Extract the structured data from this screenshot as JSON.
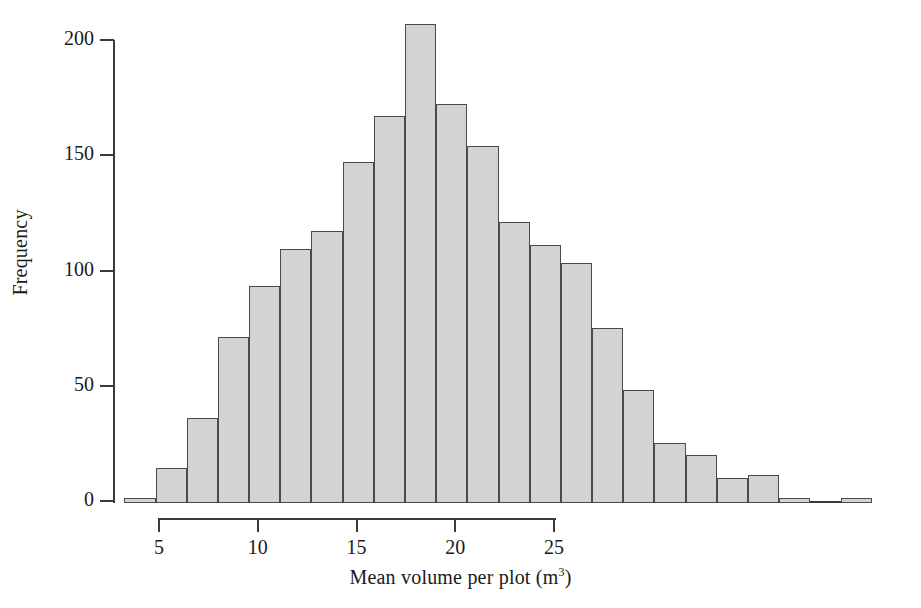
{
  "chart_data": {
    "type": "bar",
    "title": "",
    "subtitle": "",
    "xlabel_main": "Mean volume per plot (m",
    "xlabel_exponent": "3",
    "xlabel_close": ")",
    "xlabel": "Mean volume per plot (m3)",
    "ylabel": "Frequency",
    "xlim": [
      3.2,
      26.8
    ],
    "ylim": [
      0,
      208
    ],
    "grid": false,
    "legend": null,
    "bin_width": 1.585,
    "xticks": [
      5,
      10,
      15,
      20,
      25
    ],
    "xtick_labels": [
      "5",
      "10",
      "15",
      "20",
      "25"
    ],
    "yticks": [
      0,
      50,
      100,
      150,
      200
    ],
    "ytick_labels": [
      "0",
      "50",
      "100",
      "150",
      "200"
    ],
    "bins": [
      {
        "x0": 3.25,
        "x1": 4.83,
        "value": 2
      },
      {
        "x0": 4.83,
        "x1": 6.41,
        "value": 15
      },
      {
        "x0": 6.41,
        "x1": 7.99,
        "value": 37
      },
      {
        "x0": 7.99,
        "x1": 9.56,
        "value": 72
      },
      {
        "x0": 9.56,
        "x1": 11.14,
        "value": 94
      },
      {
        "x0": 11.14,
        "x1": 12.72,
        "value": 110
      },
      {
        "x0": 12.72,
        "x1": 14.3,
        "value": 118
      },
      {
        "x0": 14.3,
        "x1": 15.88,
        "value": 148
      },
      {
        "x0": 15.88,
        "x1": 17.45,
        "value": 168
      },
      {
        "x0": 17.45,
        "x1": 19.03,
        "value": 208
      },
      {
        "x0": 19.03,
        "x1": 20.61,
        "value": 173
      },
      {
        "x0": 20.61,
        "x1": 22.19,
        "value": 155
      },
      {
        "x0": 22.19,
        "x1": 23.77,
        "value": 122
      },
      {
        "x0": 23.77,
        "x1": 25.34,
        "value": 112
      },
      {
        "x0": 25.34,
        "x1": 26.92,
        "value": 104
      },
      {
        "x0": 26.92,
        "x1": 28.5,
        "value": 76
      },
      {
        "x0": 28.5,
        "x1": 30.08,
        "value": 49
      },
      {
        "x0": 30.08,
        "x1": 31.66,
        "value": 26
      },
      {
        "x0": 31.66,
        "x1": 33.23,
        "value": 21
      },
      {
        "x0": 33.23,
        "x1": 34.81,
        "value": 11
      },
      {
        "x0": 34.81,
        "x1": 36.39,
        "value": 12
      },
      {
        "x0": 36.39,
        "x1": 37.97,
        "value": 2
      },
      {
        "x0": 37.97,
        "x1": 39.55,
        "value": 0
      },
      {
        "x0": 39.55,
        "x1": 41.12,
        "value": 2
      }
    ],
    "categories": [
      "4.0",
      "5.6",
      "7.2",
      "8.8",
      "10.4",
      "11.9",
      "13.5",
      "15.1",
      "16.7",
      "18.2",
      "19.8",
      "21.4",
      "23.0",
      "24.6",
      "26.1",
      "27.7",
      "29.3",
      "30.9",
      "32.4",
      "34.0",
      "35.6",
      "37.2",
      "38.8",
      "40.3"
    ],
    "values": [
      2,
      15,
      37,
      72,
      94,
      110,
      118,
      148,
      168,
      208,
      173,
      155,
      122,
      112,
      104,
      76,
      49,
      26,
      21,
      11,
      12,
      2,
      0,
      2
    ],
    "colors": {
      "bar_fill": "#d3d3d3",
      "bar_edge": "#4a4a4a",
      "axis": "#3a3a3a",
      "text": "#1a1a1a",
      "background": "#ffffff"
    }
  }
}
